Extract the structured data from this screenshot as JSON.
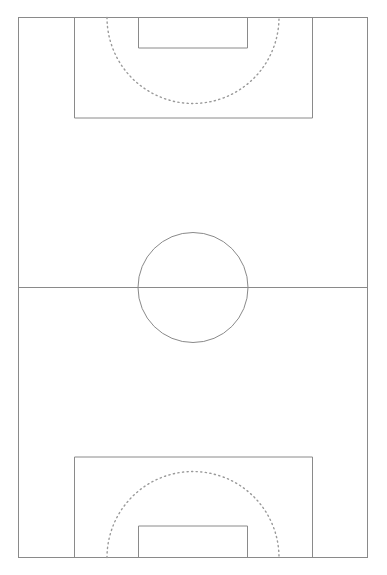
{
  "diagram": {
    "type": "sports-field-diagram",
    "canvas": {
      "width": 387,
      "height": 575
    },
    "orientation": "vertical",
    "colors": {
      "background": "#ffffff",
      "line": "#8a8a8a",
      "solid_line": "#7d7d7d",
      "dotted_line": "#9a9a9a"
    },
    "stroke": {
      "solid_width": 1,
      "dotted_width": 1.4,
      "dash_pattern": "1.2 3.4"
    },
    "features": {
      "touchline_boundary": {
        "label": "Field boundary",
        "x": 18,
        "y": 17,
        "width": 350,
        "height": 541,
        "style": "solid"
      },
      "halfway_line": {
        "label": "Halfway line",
        "x1": 18,
        "y1": 287,
        "x2": 368,
        "y2": 287,
        "style": "solid"
      },
      "centre_circle": {
        "label": "Centre circle",
        "cx": 193,
        "cy": 287,
        "r": 55,
        "style": "solid"
      },
      "top_penalty_area": {
        "label": "Penalty area (top)",
        "x": 74,
        "y": 17,
        "width": 239,
        "height": 101,
        "style": "solid"
      },
      "top_goal_area": {
        "label": "Goal area (top)",
        "x": 138,
        "y": 17,
        "width": 110,
        "height": 31,
        "style": "solid"
      },
      "top_penalty_arc": {
        "label": "Penalty arc (top)",
        "cx": 193,
        "cy": 17,
        "r": 86,
        "opens": "down",
        "style": "dotted"
      },
      "bottom_penalty_area": {
        "label": "Penalty area (bottom)",
        "x": 74,
        "y": 457,
        "width": 239,
        "height": 101,
        "style": "solid"
      },
      "bottom_goal_area": {
        "label": "Goal area (bottom)",
        "x": 138,
        "y": 526,
        "width": 110,
        "height": 32,
        "style": "solid"
      },
      "bottom_penalty_arc": {
        "label": "Penalty arc (bottom)",
        "cx": 193,
        "cy": 558,
        "r": 86,
        "opens": "up",
        "style": "dotted"
      }
    }
  }
}
